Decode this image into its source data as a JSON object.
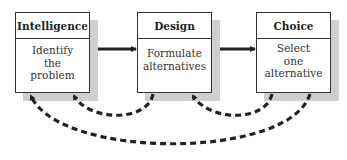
{
  "diagram": {
    "type": "process-flow",
    "stages": [
      {
        "id": "intelligence",
        "title": "Intelligence",
        "lines": [
          "Identify",
          "the",
          "problem"
        ]
      },
      {
        "id": "design",
        "title": "Design",
        "lines": [
          "Formulate",
          "alternatives"
        ]
      },
      {
        "id": "choice",
        "title": "Choice",
        "lines": [
          "Select",
          "one",
          "alternative"
        ]
      }
    ],
    "edges": [
      {
        "from": "intelligence",
        "to": "design",
        "style": "solid"
      },
      {
        "from": "design",
        "to": "choice",
        "style": "solid"
      },
      {
        "from": "design",
        "to": "intelligence",
        "style": "dashed-feedback"
      },
      {
        "from": "choice",
        "to": "design",
        "style": "dashed-feedback"
      },
      {
        "from": "choice",
        "to": "intelligence",
        "style": "dashed-feedback"
      }
    ],
    "colors": {
      "stroke": "#333333",
      "shadow": "#cfcfcf",
      "arrow": "#222222"
    }
  }
}
